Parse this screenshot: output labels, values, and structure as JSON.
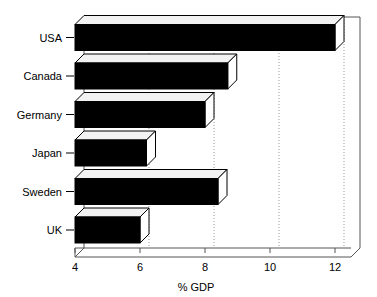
{
  "chart_data": {
    "type": "bar",
    "orientation": "horizontal",
    "style": "3d",
    "title": "",
    "subtitle": "",
    "xlabel": "% GDP",
    "ylabel": "",
    "categories": [
      "USA",
      "Canada",
      "Germany",
      "Japan",
      "Sweden",
      "UK"
    ],
    "values": [
      12.0,
      8.7,
      8.0,
      6.2,
      8.4,
      6.0
    ],
    "series": [
      {
        "name": "% GDP",
        "values": [
          12.0,
          8.7,
          8.0,
          6.2,
          8.4,
          6.0
        ]
      }
    ],
    "xlim": [
      4,
      13
    ],
    "xticks": [
      4,
      6,
      8,
      10,
      12
    ],
    "xtick_labels": [
      "4",
      "6",
      "8",
      "10",
      "12"
    ],
    "grid": true,
    "grid_axis": "x",
    "grid_style": "dotted",
    "legend": false,
    "legend_position": "none",
    "bar_face_color": "#000000",
    "bar_top_color": "#f2f2f2",
    "bar_side_color": "#ffffff",
    "bar_edge_color": "#000000",
    "grid_color": "#999999",
    "axis_color": "#000000",
    "background_color": "#ffffff"
  },
  "axis": {
    "x_title": "% GDP",
    "tick_labels": [
      "4",
      "6",
      "8",
      "10",
      "12"
    ]
  },
  "categories": {
    "labels": [
      "USA",
      "Canada",
      "Germany",
      "Japan",
      "Sweden",
      "UK"
    ]
  }
}
